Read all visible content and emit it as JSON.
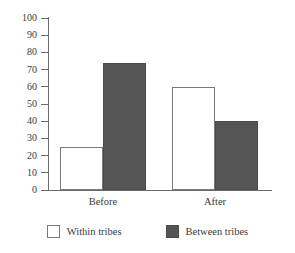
{
  "chart_data": {
    "type": "bar",
    "title": "",
    "subtitle": "",
    "xlabel": "",
    "ylabel": "",
    "categories": [
      "Before",
      "After"
    ],
    "series": [
      {
        "name": "Within tribes",
        "values": [
          25,
          74
        ],
        "color": "#ffffff"
      },
      {
        "name": "Between tribes",
        "values": [
          74,
          40
        ],
        "color": "#555555"
      }
    ],
    "ylim": [
      0,
      100
    ],
    "ytick_step": 10,
    "yticks": [
      0,
      10,
      20,
      30,
      40,
      50,
      60,
      70,
      80,
      90,
      100
    ],
    "ytick_labels": [
      "0",
      "10",
      "20",
      "30",
      "40",
      "50",
      "60",
      "70",
      "80",
      "90",
      "100"
    ],
    "grid": false,
    "legend_position": "bottom",
    "annotations": []
  },
  "chart": {
    "bars": [
      {
        "group": "Before",
        "series": "Within tribes",
        "value": 25,
        "style": "light"
      },
      {
        "group": "Before",
        "series": "Between tribes",
        "value": 74,
        "style": "dark"
      },
      {
        "group": "After",
        "series": "Within tribes",
        "value": 60,
        "style": "light"
      },
      {
        "group": "After",
        "series": "Between tribes",
        "value": 40,
        "style": "dark"
      }
    ],
    "category_labels": [
      "Before",
      "After"
    ],
    "legend": [
      {
        "label": "Within tribes",
        "style": "light"
      },
      {
        "label": "Between tribes",
        "style": "dark"
      }
    ],
    "colors": {
      "bar_light_fill": "#ffffff",
      "bar_light_stroke": "#7a7a7a",
      "bar_dark_fill": "#555555",
      "bar_dark_stroke": "#4a4a4a",
      "axis": "#6b6b6b",
      "text": "#3a3a3a",
      "background": "#ffffff"
    }
  }
}
